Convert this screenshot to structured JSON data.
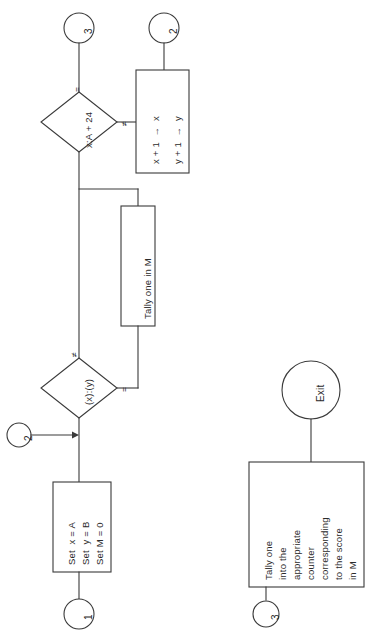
{
  "diagram": {
    "orientation": "rotated-90-ccw",
    "line_color": "#3a3a3a",
    "fill_color": "#ffffff"
  },
  "connectors": {
    "top_left": "3",
    "top_right": "2",
    "left_entry": "2",
    "bottom_left": "1",
    "bottom_right": "3"
  },
  "nodes": {
    "decision_upper": {
      "text": "x:A + 24",
      "branch_equal": "=",
      "branch_notequal": "≠"
    },
    "increment_box": {
      "line1": "x + 1  →  x",
      "line2": "y + 1  →  y"
    },
    "tally_box": {
      "text": "Tally one in M"
    },
    "decision_lower": {
      "text": "(x):(y)",
      "branch_notequal": "≠",
      "branch_equal": "="
    },
    "set_box": {
      "line1": "Set  x = A",
      "line2": "Set  y = B",
      "line3": "Set M = 0"
    },
    "exit_terminal": {
      "text": "Exit"
    },
    "final_tally_box": {
      "line1": "Tally one",
      "line2": "into the",
      "line3": "appropriate",
      "line4": "counter",
      "line5": "corresponding",
      "line6": "to the score",
      "line7": "in M"
    }
  }
}
